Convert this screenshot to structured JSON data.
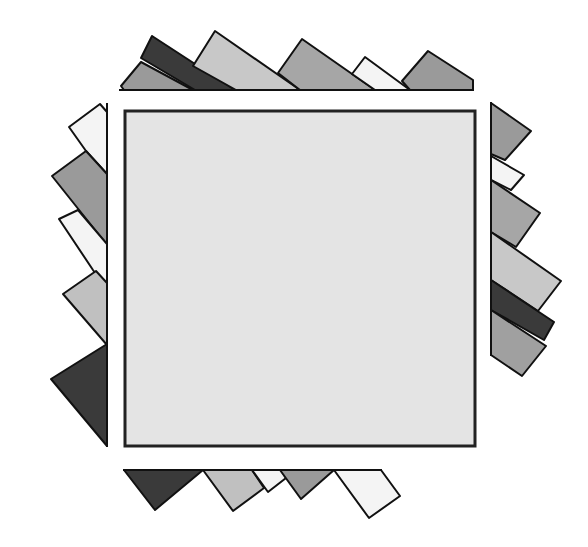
{
  "figure": {
    "width": 588,
    "height": 547,
    "background": "#ffffff",
    "stroke": "#111111",
    "center_square": {
      "x": 125,
      "y": 111,
      "width": 350,
      "height": 335,
      "fill": "#e4e4e4",
      "stroke": "#222222",
      "stroke_width": 3
    },
    "palette": {
      "dark": "#3a3a3a",
      "mid": "#9a9a9a",
      "midlight": "#b0b0b0",
      "light": "#c8c8c8",
      "white": "#f4f4f4"
    },
    "spines": [
      {
        "name": "top-baseline",
        "x1": 119,
        "y1": 90,
        "x2": 474,
        "y2": 90
      },
      {
        "name": "left-spine",
        "x1": 107,
        "y1": 103,
        "x2": 107,
        "y2": 447
      },
      {
        "name": "right-spine",
        "x1": 491,
        "y1": 102,
        "x2": 491,
        "y2": 356
      },
      {
        "name": "bottom-baseline",
        "x1": 123,
        "y1": 470,
        "x2": 382,
        "y2": 470
      }
    ],
    "strips": {
      "top": [
        {
          "name": "top-gray-triangle",
          "fill": "#9a9a9a",
          "points": "121,86 141,62 193,90 124,90"
        },
        {
          "name": "top-dark-band",
          "fill": "#3a3a3a",
          "points": "141,58 152,36 235,90 195,90"
        },
        {
          "name": "top-light-triangle",
          "fill": "#c8c8c8",
          "points": "193,66 215,31 300,90 236,90"
        },
        {
          "name": "top-mid-triangle",
          "fill": "#a6a6a6",
          "points": "278,73 302,39 375,90 300,90"
        },
        {
          "name": "top-white-triangle",
          "fill": "#f4f4f4",
          "points": "352,74 365,57 410,90 375,90"
        },
        {
          "name": "top-gray-pentagon",
          "fill": "#9a9a9a",
          "points": "402,81 428,51 473,80 473,90 410,90"
        }
      ],
      "left": [
        {
          "name": "left-white-pentagon",
          "fill": "#f4f4f4",
          "points": "100,104 107,112 107,174 86,151 69,127"
        },
        {
          "name": "left-gray-quad",
          "fill": "#9a9a9a",
          "points": "86,151 107,174 107,245 52,176"
        },
        {
          "name": "left-white-band",
          "fill": "#f4f4f4",
          "points": "78,210 107,244 107,290 93,270 59,219"
        },
        {
          "name": "left-light-quad",
          "fill": "#c0c0c0",
          "points": "96,271 107,283 107,345 63,294"
        },
        {
          "name": "left-dark-triangle",
          "fill": "#3a3a3a",
          "points": "107,344 107,446 51,379"
        }
      ],
      "right": [
        {
          "name": "right-gray-triangle",
          "fill": "#9a9a9a",
          "points": "491,103 531,131 505,160 491,154"
        },
        {
          "name": "right-white-quad",
          "fill": "#f4f4f4",
          "points": "491,156 524,175 511,190 491,180"
        },
        {
          "name": "right-gray-quad",
          "fill": "#a6a6a6",
          "points": "491,180 540,213 516,247 491,232"
        },
        {
          "name": "right-light-band",
          "fill": "#c8c8c8",
          "points": "491,232 561,281 538,311 491,280"
        },
        {
          "name": "right-dark-band",
          "fill": "#3a3a3a",
          "points": "491,280 554,322 544,340 491,310"
        },
        {
          "name": "right-gray-band",
          "fill": "#a0a0a0",
          "points": "491,310 546,346 522,376 491,355"
        }
      ],
      "bottom": [
        {
          "name": "bottom-dark-triangle",
          "fill": "#3a3a3a",
          "points": "124,470 203,470 155,510"
        },
        {
          "name": "bottom-light-quad",
          "fill": "#c0c0c0",
          "points": "203,470 252,470 264,488 233,511"
        },
        {
          "name": "bottom-white-quad",
          "fill": "#f4f4f4",
          "points": "252,470 281,470 286,478 268,492"
        },
        {
          "name": "bottom-mid-triangle",
          "fill": "#9a9a9a",
          "points": "280,470 334,470 301,499"
        },
        {
          "name": "bottom-white-pentagon",
          "fill": "#f4f4f4",
          "points": "334,470 381,470 400,496 369,518"
        }
      ]
    }
  }
}
